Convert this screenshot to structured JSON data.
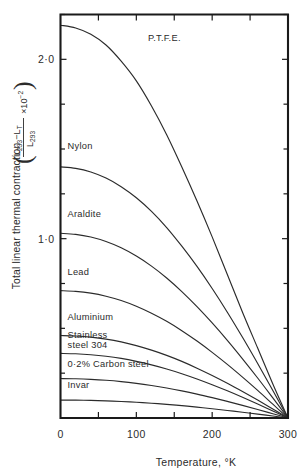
{
  "chart_data": {
    "type": "line",
    "title": "",
    "xlabel": "Temperature, °K",
    "ylabel": "Total linear thermal contraction",
    "ylabel_formula": {
      "numerator_a": "L",
      "numerator_a_sub": "293",
      "minus": "−",
      "numerator_b": "L",
      "numerator_b_sub": "T",
      "denominator": "L",
      "denominator_sub": "293",
      "multiplier": "×10",
      "multiplier_exp": "−2"
    },
    "xlim": [
      0,
      300
    ],
    "ylim": [
      0,
      2.25
    ],
    "x_ticks_major": [
      0,
      100,
      200,
      300
    ],
    "x_ticklabels": [
      "0",
      "100",
      "200",
      "300"
    ],
    "x_ticks_minor": [
      50,
      150,
      250
    ],
    "y_ticks_major": [
      1.0,
      2.0
    ],
    "y_ticklabels": [
      "1·0",
      "2·0"
    ],
    "y_ticks_minor": [
      0.25,
      0.5,
      0.75,
      1.25,
      1.5,
      1.75,
      2.25
    ],
    "grid": false,
    "legend": "none",
    "series": [
      {
        "name": "P.T.F.E.",
        "label": "P.T.F.E.",
        "label_x": 110,
        "label_y": 2.1,
        "x": [
          0,
          20,
          40,
          60,
          80,
          100,
          120,
          140,
          160,
          180,
          200,
          220,
          240,
          260,
          280,
          300
        ],
        "values": [
          2.19,
          2.175,
          2.14,
          2.08,
          1.99,
          1.88,
          1.74,
          1.58,
          1.4,
          1.21,
          1.01,
          0.8,
          0.59,
          0.39,
          0.19,
          0.0
        ]
      },
      {
        "name": "Nylon",
        "label": "Nylon",
        "label_x": 4,
        "label_y": 1.5,
        "x": [
          0,
          20,
          40,
          60,
          80,
          100,
          120,
          140,
          160,
          180,
          200,
          220,
          240,
          260,
          280,
          300
        ],
        "values": [
          1.4,
          1.392,
          1.372,
          1.338,
          1.29,
          1.228,
          1.152,
          1.062,
          0.958,
          0.845,
          0.722,
          0.59,
          0.45,
          0.304,
          0.153,
          0.0
        ]
      },
      {
        "name": "Araldite",
        "label": "Araldite",
        "label_x": 4,
        "label_y": 1.12,
        "x": [
          0,
          20,
          40,
          60,
          80,
          100,
          120,
          140,
          160,
          180,
          200,
          220,
          240,
          260,
          280,
          300
        ],
        "values": [
          1.03,
          1.024,
          1.009,
          0.984,
          0.949,
          0.903,
          0.847,
          0.781,
          0.705,
          0.621,
          0.53,
          0.433,
          0.33,
          0.223,
          0.112,
          0.0
        ]
      },
      {
        "name": "Lead",
        "label": "Lead",
        "label_x": 4,
        "label_y": 0.8,
        "x": [
          0,
          20,
          40,
          60,
          80,
          100,
          120,
          140,
          160,
          180,
          200,
          220,
          240,
          260,
          280,
          300
        ],
        "values": [
          0.71,
          0.706,
          0.696,
          0.679,
          0.655,
          0.623,
          0.584,
          0.539,
          0.487,
          0.429,
          0.366,
          0.299,
          0.228,
          0.154,
          0.077,
          0.0
        ]
      },
      {
        "name": "Aluminium",
        "label": "Aluminium",
        "label_x": 4,
        "label_y": 0.545,
        "x": [
          0,
          20,
          40,
          60,
          80,
          100,
          120,
          140,
          160,
          180,
          200,
          220,
          240,
          260,
          280,
          300
        ],
        "values": [
          0.46,
          0.4575,
          0.4508,
          0.44,
          0.4245,
          0.4037,
          0.3784,
          0.3493,
          0.3157,
          0.278,
          0.2372,
          0.1937,
          0.1477,
          0.0998,
          0.0501,
          0.0
        ]
      },
      {
        "name": "Stainless steel 304",
        "label": "Stainless",
        "label_line2": "steel 304",
        "label_x": 4,
        "label_y": 0.445,
        "x": [
          0,
          20,
          40,
          60,
          80,
          100,
          120,
          140,
          160,
          180,
          200,
          220,
          240,
          260,
          280,
          300
        ],
        "values": [
          0.36,
          0.358,
          0.3528,
          0.3443,
          0.3322,
          0.3159,
          0.2961,
          0.2733,
          0.2471,
          0.2176,
          0.1856,
          0.1516,
          0.1156,
          0.0781,
          0.0392,
          0.0
        ]
      },
      {
        "name": "0·2% Carbon steel",
        "label": "0·2% Carbon steel",
        "label_x": 4,
        "label_y": 0.285,
        "x": [
          0,
          20,
          40,
          60,
          80,
          100,
          120,
          140,
          160,
          180,
          200,
          220,
          240,
          260,
          280,
          300
        ],
        "values": [
          0.22,
          0.2188,
          0.2156,
          0.2104,
          0.203,
          0.1931,
          0.181,
          0.167,
          0.151,
          0.133,
          0.1134,
          0.0926,
          0.0707,
          0.0477,
          0.024,
          0.0
        ]
      },
      {
        "name": "Invar",
        "label": "Invar",
        "label_x": 4,
        "label_y": 0.165,
        "x": [
          0,
          20,
          40,
          60,
          80,
          100,
          120,
          140,
          160,
          180,
          200,
          220,
          240,
          260,
          280,
          300
        ],
        "values": [
          0.1,
          0.0995,
          0.098,
          0.0957,
          0.0923,
          0.0878,
          0.0823,
          0.0759,
          0.0687,
          0.0605,
          0.0516,
          0.0421,
          0.0321,
          0.0217,
          0.0109,
          0.0
        ]
      }
    ]
  }
}
